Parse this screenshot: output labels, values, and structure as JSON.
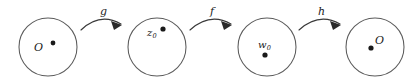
{
  "figure": {
    "type": "commutative-mapping-diagram",
    "background_color": "#ffffff",
    "stroke_color": "#5a5a5a",
    "point_color": "#1a1a1a",
    "width": 416,
    "height": 82
  },
  "domains": [
    {
      "id": "domain-1",
      "label": "O",
      "subscript": "",
      "cx": 48,
      "cy": 47,
      "r": 29,
      "point_x": 53,
      "point_y": 43,
      "point_r": 2.4,
      "label_left": 34,
      "label_top": 42,
      "label_size": 11
    },
    {
      "id": "domain-2",
      "label": "z",
      "subscript": "0",
      "cx": 157,
      "cy": 47,
      "r": 29,
      "point_x": 163,
      "point_y": 29,
      "point_r": 2.6,
      "label_left": 147,
      "label_top": 28,
      "label_size": 10
    },
    {
      "id": "domain-3",
      "label": "w",
      "subscript": "0",
      "cx": 267,
      "cy": 47,
      "r": 29,
      "point_x": 265,
      "point_y": 55,
      "point_r": 2.6,
      "label_left": 258,
      "label_top": 40,
      "label_size": 10
    },
    {
      "id": "domain-4",
      "label": "O",
      "subscript": "",
      "cx": 375,
      "cy": 47,
      "r": 29,
      "point_x": 371,
      "point_y": 48,
      "point_r": 2.6,
      "label_left": 375,
      "label_top": 35,
      "label_size": 11
    }
  ],
  "maps": [
    {
      "id": "map-g",
      "label": "g",
      "from": "domain-1",
      "to": "domain-2",
      "path": "M 81 30 Q 100 12 121 24",
      "head_points": "121,24 112,22 114,29",
      "label_left": 100,
      "label_top": 6
    },
    {
      "id": "map-f",
      "label": "f",
      "from": "domain-2",
      "to": "domain-3",
      "path": "M 190 30 Q 210 12 231 24",
      "head_points": "231,24 222,22 224,29",
      "label_left": 210,
      "label_top": 6
    },
    {
      "id": "map-h",
      "label": "h",
      "from": "domain-3",
      "to": "domain-4",
      "path": "M 299 30 Q 319 12 340 24",
      "head_points": "340,24 331,22 333,29",
      "label_left": 318,
      "label_top": 6
    }
  ]
}
